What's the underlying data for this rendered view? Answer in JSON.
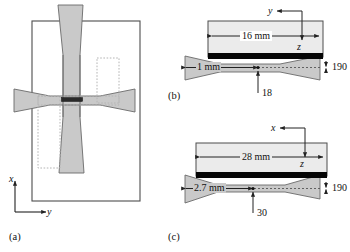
{
  "figure": {
    "type": "schematic-diagram",
    "colors": {
      "fill_gray": "#c9c9c9",
      "fill_light": "#ebebeb",
      "black": "#000000",
      "outline": "#555555",
      "dotted": "#b0b0b0",
      "background": "#ffffff"
    }
  },
  "panels": {
    "a": {
      "label": "(a)",
      "axes": {
        "vertical_label": "x",
        "horizontal_label": "y"
      }
    },
    "b": {
      "label": "(b)",
      "axes": {
        "horizontal_label": "y",
        "vertical_label": "z"
      },
      "dimensions": {
        "block_width": "16 mm",
        "horn_waist": "1 mm",
        "gap_thickness": "190",
        "offset": "18"
      }
    },
    "c": {
      "label": "(c)",
      "axes": {
        "horizontal_label": "x",
        "vertical_label": "z"
      },
      "dimensions": {
        "block_width": "28 mm",
        "horn_waist": "2.7 mm",
        "gap_thickness": "190",
        "offset": "30"
      }
    }
  }
}
